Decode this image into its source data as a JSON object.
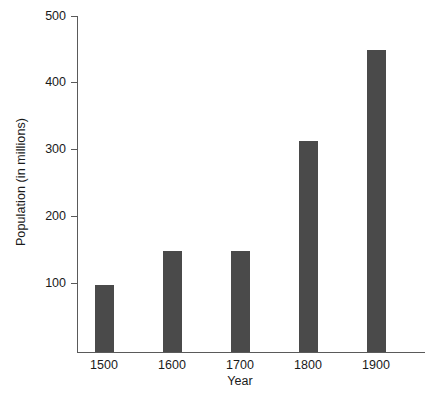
{
  "chart_data": {
    "type": "bar",
    "title": "",
    "xlabel": "Year",
    "ylabel": "Population (in millions)",
    "categories": [
      "1500",
      "1600",
      "1700",
      "1800",
      "1900"
    ],
    "values": [
      100,
      150,
      150,
      315,
      450
    ],
    "ytick_labels": [
      "100",
      "200",
      "300",
      "400",
      "500"
    ],
    "ytick_values": [
      100,
      200,
      300,
      400,
      500
    ],
    "ylim": [
      0,
      520
    ],
    "grid": false,
    "legend": null,
    "bar_color": "#4a4a4a",
    "axis_color": "#5a5a5a",
    "text_color": "#1a1a1a",
    "background": "#ffffff"
  }
}
